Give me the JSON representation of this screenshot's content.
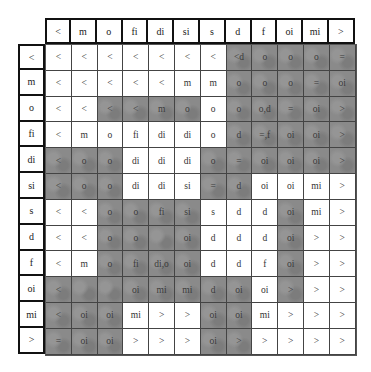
{
  "table": {
    "column_headers": [
      "<",
      "m",
      "o",
      "fi",
      "di",
      "si",
      "s",
      "d",
      "f",
      "oi",
      "mi",
      ">"
    ],
    "row_headers": [
      "<",
      "m",
      "o",
      "fi",
      "di",
      "si",
      "s",
      "d",
      "f",
      "oi",
      "mi",
      ">"
    ],
    "shade_color": "#8a8a8a",
    "rows": [
      {
        "cells": [
          "<",
          "<",
          "<",
          "<",
          "<",
          "<",
          "<",
          "<d",
          "o",
          "o",
          "o",
          "="
        ],
        "shaded": [
          0,
          0,
          0,
          0,
          0,
          0,
          0,
          1,
          1,
          1,
          1,
          1
        ]
      },
      {
        "cells": [
          "<",
          "<",
          "<",
          "<",
          "<",
          "m",
          "m",
          "o",
          "o",
          "o",
          "=",
          "oi"
        ],
        "shaded": [
          0,
          0,
          0,
          0,
          0,
          0,
          0,
          1,
          1,
          1,
          1,
          1
        ]
      },
      {
        "cells": [
          "<",
          "<",
          "<",
          "<",
          "m",
          "o",
          "o",
          "o",
          "o,d",
          "=",
          "oi",
          ">"
        ],
        "shaded": [
          0,
          0,
          1,
          1,
          1,
          1,
          0,
          1,
          1,
          1,
          1,
          1
        ]
      },
      {
        "cells": [
          "<",
          "m",
          "o",
          "fi",
          "di",
          "di",
          "o",
          "d",
          "=,f",
          "oi",
          "oi",
          ">"
        ],
        "shaded": [
          0,
          0,
          0,
          0,
          0,
          0,
          0,
          1,
          1,
          1,
          1,
          1
        ]
      },
      {
        "cells": [
          "<",
          "o",
          "o",
          "di",
          "di",
          "di",
          "o",
          "=",
          "oi",
          "oi",
          "oi",
          ">"
        ],
        "shaded": [
          1,
          1,
          1,
          0,
          0,
          0,
          1,
          1,
          1,
          1,
          1,
          1
        ]
      },
      {
        "cells": [
          "<",
          "o",
          "o",
          "di",
          "di",
          "si",
          "=",
          "d",
          "oi",
          "oi",
          "mi",
          ">"
        ],
        "shaded": [
          1,
          1,
          1,
          0,
          0,
          0,
          1,
          1,
          0,
          0,
          0,
          0
        ]
      },
      {
        "cells": [
          "<",
          "<",
          "o",
          "o",
          "fi",
          "si",
          "s",
          "d",
          "d",
          "oi",
          "mi",
          ">"
        ],
        "shaded": [
          0,
          0,
          1,
          1,
          1,
          1,
          0,
          0,
          0,
          1,
          0,
          0
        ]
      },
      {
        "cells": [
          "<",
          "<",
          "o",
          "o",
          "",
          "oi",
          "d",
          "d",
          "d",
          "oi",
          ">",
          ">"
        ],
        "shaded": [
          0,
          0,
          1,
          1,
          1,
          1,
          0,
          0,
          0,
          1,
          0,
          0
        ]
      },
      {
        "cells": [
          "<",
          "m",
          "o",
          "fi",
          "di,o",
          "oi",
          "d",
          "d",
          "f",
          "oi",
          ">",
          ">"
        ],
        "shaded": [
          0,
          0,
          1,
          1,
          1,
          1,
          0,
          0,
          0,
          1,
          0,
          0
        ]
      },
      {
        "cells": [
          "<",
          "",
          "",
          "oi",
          "mi",
          "mi",
          "d",
          "oi",
          "oi",
          ">",
          ">",
          ">"
        ],
        "shaded": [
          1,
          1,
          1,
          1,
          1,
          1,
          1,
          1,
          0,
          1,
          0,
          0
        ]
      },
      {
        "cells": [
          "<",
          "oi",
          "oi",
          "mi",
          ">",
          ">",
          "oi",
          "oi",
          "mi",
          ">",
          ">",
          ">"
        ],
        "shaded": [
          1,
          1,
          1,
          0,
          0,
          0,
          1,
          1,
          0,
          0,
          0,
          0
        ]
      },
      {
        "cells": [
          "=",
          "oi",
          "oi",
          ">",
          ">",
          ">",
          "oi",
          ">",
          ">",
          ">",
          ">",
          ">"
        ],
        "shaded": [
          1,
          1,
          1,
          0,
          0,
          0,
          1,
          1,
          0,
          0,
          0,
          0
        ]
      }
    ]
  }
}
